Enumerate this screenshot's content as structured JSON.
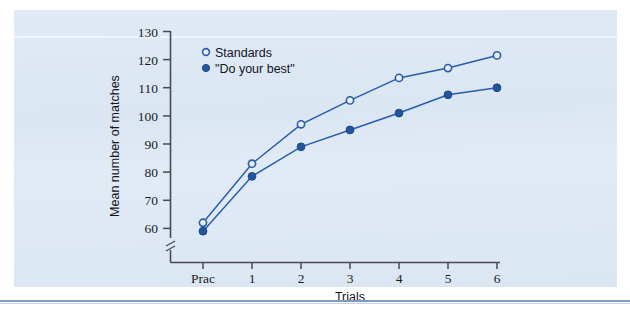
{
  "figure": {
    "background_color": "#dde8f4",
    "accent_color": "#2a5ca8"
  },
  "chart_data": {
    "type": "line",
    "title": "",
    "xlabel": "Trials",
    "ylabel": "Mean number of matches",
    "categories": [
      "Prac",
      "1",
      "2",
      "3",
      "4",
      "5",
      "6"
    ],
    "ylim": [
      55,
      130
    ],
    "yticks": [
      60,
      70,
      80,
      90,
      100,
      110,
      120,
      130
    ],
    "ytick_labels": [
      "60",
      "70",
      "80",
      "90",
      "100",
      "110",
      "120",
      "130"
    ],
    "axis_break": true,
    "grid": false,
    "legend_position": "top-left",
    "series": [
      {
        "name": "Standards",
        "marker": "open-circle",
        "color": "#2a5ca8",
        "values": [
          62,
          83,
          97,
          105.5,
          113.5,
          117,
          121.5
        ]
      },
      {
        "name": "\"Do your best\"",
        "marker": "filled-circle",
        "color": "#23549e",
        "values": [
          59,
          78.5,
          89,
          95,
          101,
          107.5,
          110
        ]
      }
    ]
  },
  "legend": {
    "items": [
      {
        "label": "Standards",
        "marker": "open-circle"
      },
      {
        "label": "\"Do your best\"",
        "marker": "filled-circle"
      }
    ]
  }
}
